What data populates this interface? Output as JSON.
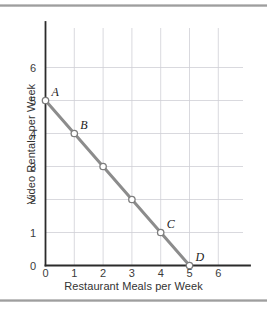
{
  "figure": {
    "background": "#ffffff",
    "rule_color": "#9a9a9a"
  },
  "chart_data": {
    "type": "line",
    "title": "",
    "subtitle": "",
    "xlabel": "Restaurant Meals per Week",
    "ylabel": "Video Rentals per Week",
    "xlim": [
      0,
      6.6
    ],
    "ylim": [
      0,
      6.5
    ],
    "xticks": [
      "0",
      "1",
      "2",
      "3",
      "4",
      "5",
      "6"
    ],
    "yticks": [
      "0",
      "1",
      "2",
      "3",
      "4",
      "5",
      "6"
    ],
    "xtick_values": [
      0,
      1,
      2,
      3,
      4,
      5,
      6
    ],
    "ytick_values": [
      0,
      1,
      2,
      3,
      4,
      5,
      6
    ],
    "grid": true,
    "grid_color": "#cfcfd6",
    "axis_color": "#2b2b2b",
    "legend": "none",
    "series": [
      {
        "name": "Budget constraint",
        "color": "#8c8c8c",
        "x": [
          0,
          1,
          2,
          3,
          4,
          5
        ],
        "values": [
          5,
          4,
          3,
          2,
          1,
          0
        ]
      }
    ],
    "points": [
      {
        "label": "A",
        "x": 0,
        "y": 5
      },
      {
        "label": "B",
        "x": 1,
        "y": 4
      },
      {
        "label": "",
        "x": 2,
        "y": 3
      },
      {
        "label": "",
        "x": 3,
        "y": 2
      },
      {
        "label": "C",
        "x": 4,
        "y": 1
      },
      {
        "label": "D",
        "x": 5,
        "y": 0
      }
    ],
    "marker": {
      "shape": "circle-open",
      "fill": "#ffffff",
      "stroke": "#7d7d7d",
      "radius": 3.2
    },
    "annotations": [
      {
        "text": "A",
        "x": 0,
        "y": 5
      },
      {
        "text": "B",
        "x": 1,
        "y": 4
      },
      {
        "text": "C",
        "x": 4,
        "y": 1
      },
      {
        "text": "D",
        "x": 5,
        "y": 0
      }
    ]
  }
}
